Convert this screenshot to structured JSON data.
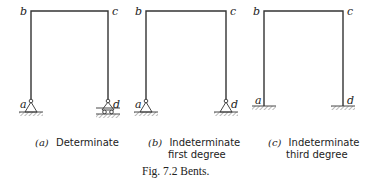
{
  "figure": {
    "title": "Fig. 7.2  Bents.",
    "panels": [
      {
        "id": "a",
        "tag": "(a)",
        "caption_line1": "Determinate",
        "caption_line2": "",
        "nodes": {
          "a": "a",
          "b": "b",
          "c": "c",
          "d": "d"
        },
        "supports": {
          "left": "pin",
          "right": "roller"
        }
      },
      {
        "id": "b",
        "tag": "(b)",
        "caption_line1": "Indeterminate",
        "caption_line2": "first degree",
        "nodes": {
          "a": "a",
          "b": "b",
          "c": "c",
          "d": "d"
        },
        "supports": {
          "left": "pin",
          "right": "pin"
        }
      },
      {
        "id": "c",
        "tag": "(c)",
        "caption_line1": "Indeterminate",
        "caption_line2": "third degree",
        "nodes": {
          "a": "a",
          "b": "b",
          "c": "c",
          "d": "d"
        },
        "supports": {
          "left": "fixed",
          "right": "fixed"
        }
      }
    ]
  }
}
